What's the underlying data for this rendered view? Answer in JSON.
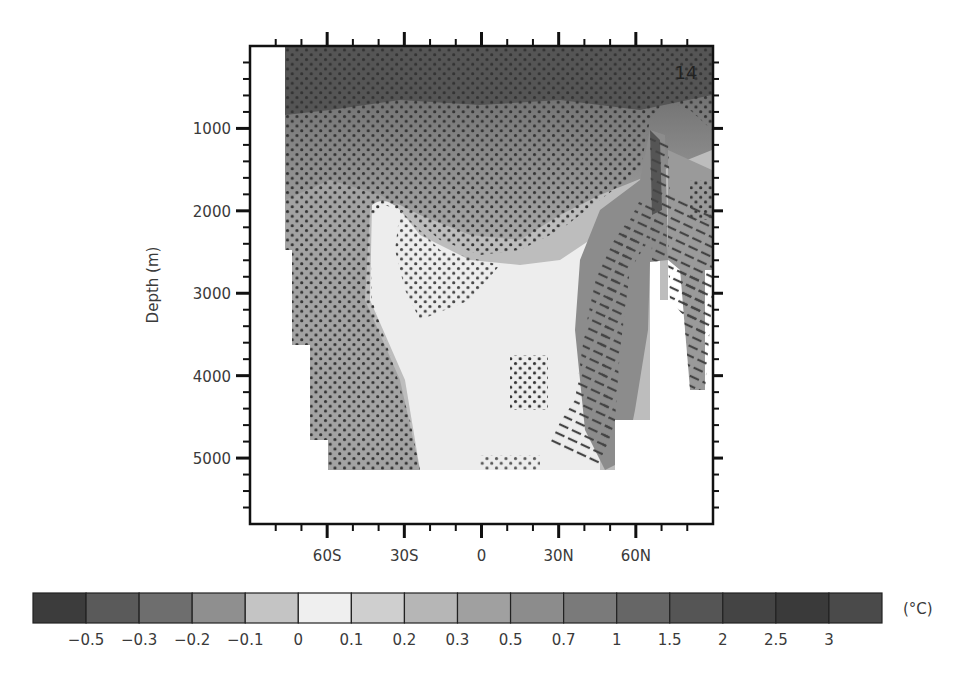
{
  "chart_data": {
    "type": "heatmap",
    "title": "",
    "panel_label": "14",
    "xlabel": "",
    "ylabel": "Depth (m)",
    "x_ticks": [
      {
        "value": -60,
        "label": "60S"
      },
      {
        "value": -30,
        "label": "30S"
      },
      {
        "value": 0,
        "label": "0"
      },
      {
        "value": 30,
        "label": "30N"
      },
      {
        "value": 60,
        "label": "60N"
      }
    ],
    "y_ticks": [
      {
        "value": 1000,
        "label": "1000"
      },
      {
        "value": 2000,
        "label": "2000"
      },
      {
        "value": 3000,
        "label": "3000"
      },
      {
        "value": 4000,
        "label": "4000"
      },
      {
        "value": 5000,
        "label": "5000"
      }
    ],
    "xlim": [
      -90,
      90
    ],
    "ylim": [
      5800,
      0
    ],
    "grid": false,
    "colorbar": {
      "unit": "(°C)",
      "position": "bottom",
      "levels": [
        "-0.5",
        "-0.3",
        "-0.2",
        "-0.1",
        "0",
        "0.1",
        "0.2",
        "0.3",
        "0.5",
        "0.7",
        "1",
        "1.5",
        "2",
        "2.5",
        "3"
      ],
      "level_labels": [
        "−0.5",
        "−0.3",
        "−0.2",
        "−0.1",
        "0",
        "0.1",
        "0.2",
        "0.3",
        "0.5",
        "0.7",
        "1",
        "1.5",
        "2",
        "2.5",
        "3"
      ],
      "colors": [
        "#3c3c3c",
        "#5a5a5a",
        "#6e6e6e",
        "#8f8f8f",
        "#c4c4c4",
        "#efefef",
        "#cfcfcf",
        "#b6b6b6",
        "#a0a0a0",
        "#8c8c8c",
        "#7a7a7a",
        "#666666",
        "#555555",
        "#444444",
        "#3a3a3a",
        "#4a4a4a"
      ]
    },
    "field_description": "Zonal-mean ocean temperature change vs latitude and depth; warmest (dark) in upper ~1000 m, near-zero (light) in deep low latitudes, strong warming tongue at 60N down to ~3800 m",
    "stippling": "dots over most of the upper ocean and southern deep ocean",
    "hatching": "diagonal hatching between ~35N and ~80N from ~1200 m to ~5100 m"
  }
}
